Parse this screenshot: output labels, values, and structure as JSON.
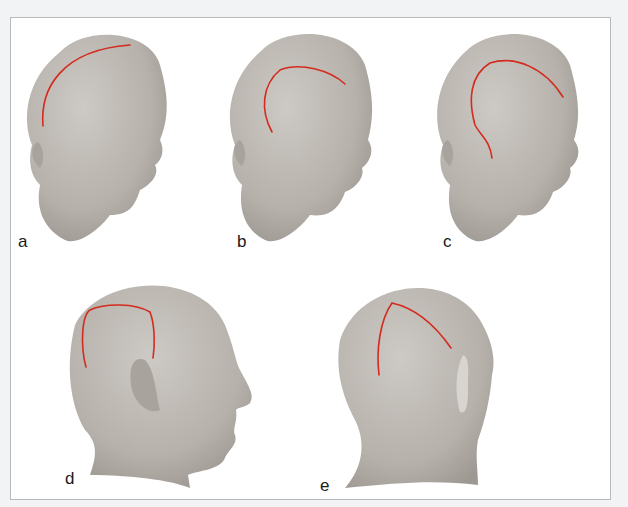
{
  "figure": {
    "type": "medical-illustration",
    "incision_color": "#d42b1e",
    "skin_color": "#b9b4ae",
    "panels": [
      {
        "label": "a",
        "view": "three-quarter anterolateral",
        "incision": "curved line from top of head down to above ear"
      },
      {
        "label": "b",
        "view": "three-quarter anterolateral",
        "incision": "question-mark shaped arc over temporal region"
      },
      {
        "label": "c",
        "view": "three-quarter anterolateral",
        "incision": "large question-mark arc descending to in front of ear"
      },
      {
        "label": "d",
        "view": "lateral profile",
        "incision": "horseshoe/U-shaped flap above ear"
      },
      {
        "label": "e",
        "view": "posterolateral",
        "incision": "inverted V / linear arc over parieto-occipital region"
      }
    ]
  }
}
